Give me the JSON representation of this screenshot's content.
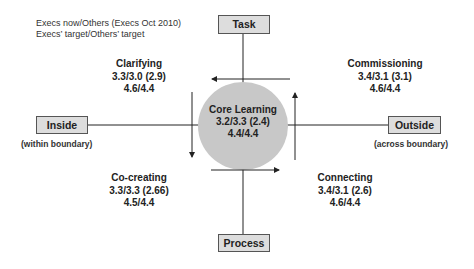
{
  "legend": {
    "line1": "Execs now/Others (Execs Oct 2010)",
    "line2": "Execs’ target/Others’ target"
  },
  "axes": {
    "top": {
      "label": "Task"
    },
    "bottom": {
      "label": "Process"
    },
    "left": {
      "label": "Inside",
      "sublabel": "(within boundary)"
    },
    "right": {
      "label": "Outside",
      "sublabel": "(across boundary)"
    }
  },
  "core": {
    "title": "Core Learning",
    "now": "3.2/3.3 (2.4)",
    "target": "4.4/4.4"
  },
  "quadrants": {
    "top_left": {
      "title": "Clarifying",
      "now": "3.3/3.0 (2.9)",
      "target": "4.6/4.4"
    },
    "top_right": {
      "title": "Commissioning",
      "now": "3.4/3.1 (3.1)",
      "target": "4.6/4.4"
    },
    "bottom_left": {
      "title": "Co-creating",
      "now": "3.3/3.3 (2.66)",
      "target": "4.5/4.4"
    },
    "bottom_right": {
      "title": "Connecting",
      "now": "3.4/3.1 (2.6)",
      "target": "4.6/4.4"
    }
  },
  "colors": {
    "box_fill": "#dddddd",
    "circle_fill": "#c8c8c8",
    "line": "#222222"
  }
}
